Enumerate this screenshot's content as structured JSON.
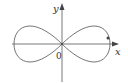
{
  "diagram": {
    "title": "",
    "curve": "lemniscate (figure-eight)",
    "axes": {
      "x_label": "x",
      "y_label": "y",
      "origin_label": "0"
    },
    "marked_point": "dot on right lobe near positive x-axis",
    "colors": {
      "axis": "#555555",
      "curve": "#666666",
      "text": "#333333",
      "background": "#ffffff"
    }
  }
}
